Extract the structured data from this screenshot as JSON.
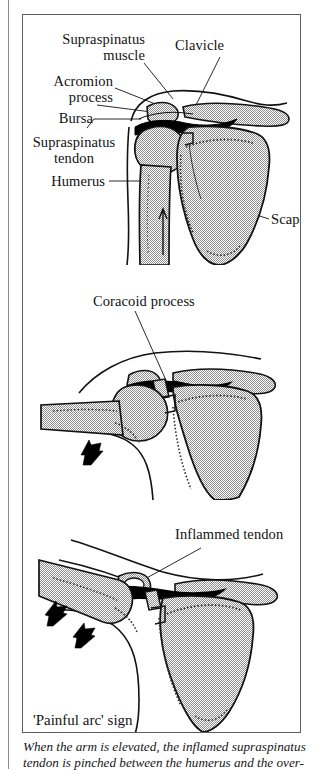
{
  "figure": {
    "title": "'Painful arc' sign",
    "caption_lines": [
      "When the arm is elevated, the inflamed supraspinatus",
      "tendon is pinched between the humerus and the over-"
    ],
    "colors": {
      "ink": "#111111",
      "bone_stipple": "#b9b9b9",
      "bursa_black": "#000000",
      "frame": "#5d5d5d",
      "paper": "#ffffff"
    },
    "panels": [
      {
        "id": "panel-neutral",
        "name": "shoulder-neutral-position",
        "labels": [
          {
            "name": "label-supraspinatus-muscle",
            "text": "Supraspinatus\nmuscle"
          },
          {
            "name": "label-clavicle",
            "text": "Clavicle"
          },
          {
            "name": "label-acromion-process",
            "text": "Acromion\nprocess"
          },
          {
            "name": "label-bursa",
            "text": "Bursa"
          },
          {
            "name": "label-supraspinatus-tendon",
            "text": "Supraspinatus\ntendon"
          },
          {
            "name": "label-humerus",
            "text": "Humerus"
          },
          {
            "name": "label-scapula",
            "text": "Scapula"
          }
        ]
      },
      {
        "id": "panel-abducted",
        "name": "shoulder-partly-elevated",
        "labels": [
          {
            "name": "label-coracoid-process",
            "text": "Coracoid process"
          }
        ],
        "arrows": 1
      },
      {
        "id": "panel-inflamed",
        "name": "shoulder-elevated-inflamed",
        "labels": [
          {
            "name": "label-inflamed-tendon",
            "text": "Inflammed tendon"
          }
        ],
        "arrows": 2
      }
    ]
  }
}
